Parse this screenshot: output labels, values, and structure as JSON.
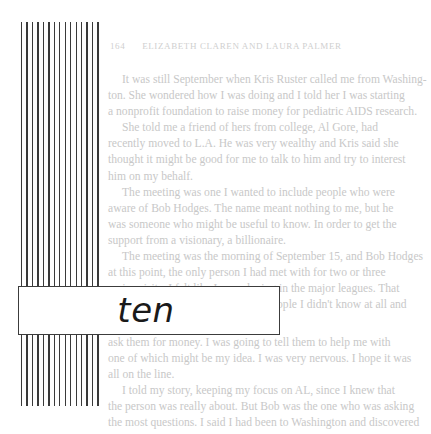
{
  "page": {
    "running_head": {
      "folio": "164",
      "authors": "ELIZABETH CLAREN AND LAURA PALMER"
    },
    "chapter_label": "ten",
    "show_through_text": {
      "upper_lines": [
        {
          "text": "It was still September when Kris Ruster called me from Washing-",
          "indent": true
        },
        {
          "text": "ton. She wondered how I was doing and I told her I was starting",
          "indent": false
        },
        {
          "text": "a nonprofit foundation to raise money for pediatric AIDS research.",
          "indent": false
        },
        {
          "text": "She told me a friend of hers from college, Al Gore, had",
          "indent": true
        },
        {
          "text": "recently moved to L.A. He was very wealthy and Kris said she",
          "indent": false
        },
        {
          "text": "thought it might be good for me to talk to him and try to interest",
          "indent": false
        },
        {
          "text": "him on my behalf.",
          "indent": false
        },
        {
          "text": "The meeting was one I wanted to include people who were",
          "indent": true
        },
        {
          "text": "aware of Bob Hodges. The name meant nothing to me, but he",
          "indent": false
        },
        {
          "text": "was someone who might be useful to know. In order to get the",
          "indent": false
        },
        {
          "text": "support from a visionary, a billionaire.",
          "indent": false
        },
        {
          "text": "The meeting was the morning of September 15, and Bob Hodges",
          "indent": true
        },
        {
          "text": "at this point, the only person I had met with for two or three",
          "indent": false
        },
        {
          "text": "major visits. I felt like I was playing in the major leagues. That",
          "indent": false
        },
        {
          "text": "was one. I was going to meet two people I didn't know at all and",
          "indent": false
        }
      ],
      "lower_lines": [
        {
          "text": "ask them for money. I was going to tell them to help me with",
          "indent": false
        },
        {
          "text": "one of which might be my idea. I was very nervous. I hope it was",
          "indent": false
        },
        {
          "text": "all on the line.",
          "indent": false
        },
        {
          "text": "I told my story, keeping my focus on AL, since I knew that",
          "indent": true
        },
        {
          "text": "the person was really about. But Bob was the one who was asking",
          "indent": false
        },
        {
          "text": "the most questions. I said I had been to Washington and discovered",
          "indent": false
        }
      ]
    }
  }
}
